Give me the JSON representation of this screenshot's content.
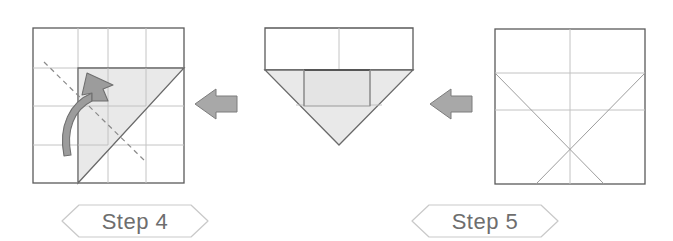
{
  "document": {
    "type": "origami-fold-instructions",
    "canvas": {
      "width": 673,
      "height": 241,
      "background": "#ffffff"
    }
  },
  "palette": {
    "paper_outline": "#5a5a5a",
    "crease_line": "#b9b9b9",
    "shaded_fill": "#e9e9e9",
    "shaded_stroke": "#9a9a9a",
    "arrow_fill": "#a8a8a8",
    "arrow_stroke": "#7a7a7a",
    "fold_arrow_fill": "#9c9c9c",
    "dashed_line": "#8a8a8a",
    "label_text": "#6e6e6e",
    "label_frame": "#c9c9c9",
    "paper_face": "#ffffff"
  },
  "steps": [
    {
      "id": "step-4",
      "label": "Step 4",
      "label_position": {
        "x": 135,
        "y": 221
      },
      "figure": {
        "name": "square-with-folded-corner-flap",
        "bounds": {
          "x": 33,
          "y": 28,
          "width": 151,
          "height": 155
        },
        "shaded_region": "upper-right-triangular-flap",
        "has_dashed_fold_line": true,
        "has_curved_fold_arrow": true,
        "fold_direction": "up-and-right"
      }
    },
    {
      "id": "step-5",
      "label": "Step 5",
      "label_position": {
        "x": 485,
        "y": 221
      },
      "figure": {
        "name": "pentagon-home-plate-with-flap",
        "bounds": {
          "x": 265,
          "y": 28,
          "width": 148,
          "height": 117
        },
        "apex": {
          "x": 339,
          "y": 145
        },
        "shoulder_y": 70,
        "shaded_region": "lower-triangle-and-center-rectangle"
      }
    }
  ],
  "result_figure": {
    "name": "unfolded-square-crease-pattern",
    "bounds": {
      "x": 495,
      "y": 29,
      "width": 150,
      "height": 155
    },
    "creases": [
      "horizontal-quarter",
      "horizontal-half",
      "vertical-center",
      "diagonal-left-to-right",
      "diagonal-right-to-left"
    ]
  },
  "arrows": [
    {
      "id": "arrow-1",
      "direction": "right",
      "x": 195,
      "y": 104
    },
    {
      "id": "arrow-2",
      "direction": "right",
      "x": 430,
      "y": 104
    }
  ]
}
